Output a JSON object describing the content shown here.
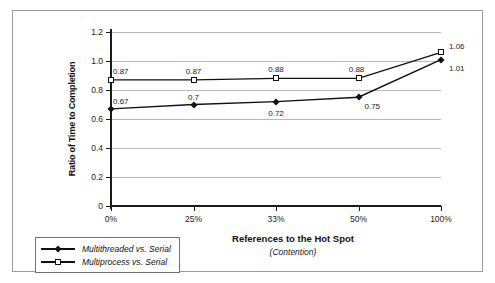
{
  "chart_data": {
    "type": "line",
    "title": "",
    "xlabel": "References to the Hot Spot",
    "xlabel_sub": "(Contention)",
    "ylabel": "Ratio of Time to Completion",
    "categories": [
      "0%",
      "25%",
      "33%",
      "50%",
      "100%"
    ],
    "ylim": [
      0,
      1.2
    ],
    "yticks": [
      "0",
      "0.2",
      "0.4",
      "0.6",
      "0.8",
      "1.0",
      "1.2"
    ],
    "ytick_values": [
      0,
      0.2,
      0.4,
      0.6,
      0.8,
      1.0,
      1.2
    ],
    "grid": true,
    "legend_position": "bottom-left",
    "series": [
      {
        "name": "Multithreaded vs. Serial",
        "marker": "filled-diamond",
        "color": "#111111",
        "values": [
          0.67,
          0.7,
          0.72,
          0.75,
          1.01
        ],
        "labels": [
          "0.67",
          "0.7",
          "0.72",
          "0.75",
          "1.01"
        ]
      },
      {
        "name": "Multiprocess vs. Serial",
        "marker": "open-square",
        "color": "#111111",
        "values": [
          0.87,
          0.87,
          0.88,
          0.88,
          1.06
        ],
        "labels": [
          "0.87",
          "0.87",
          "0.88",
          "0.88",
          "1.06"
        ]
      }
    ]
  },
  "legend": {
    "items": [
      {
        "label": "Multithreaded vs. Serial"
      },
      {
        "label": "Multiprocess vs. Serial"
      }
    ]
  },
  "colors": {
    "gridline": "#b9b9b9",
    "axis": "#1a1a1a",
    "frame": "#9a9a9a",
    "text": "#222222"
  }
}
